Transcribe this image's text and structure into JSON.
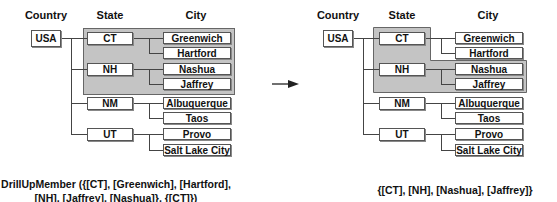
{
  "headers": {
    "country": "Country",
    "state": "State",
    "city": "City"
  },
  "before": {
    "country": "USA",
    "states": [
      {
        "name": "CT",
        "cities": [
          "Greenwich",
          "Hartford"
        ]
      },
      {
        "name": "NH",
        "cities": [
          "Nashua",
          "Jaffrey"
        ]
      },
      {
        "name": "NM",
        "cities": [
          "Albuquerque",
          "Taos"
        ]
      },
      {
        "name": "UT",
        "cities": [
          "Provo",
          "Salt Lake City"
        ]
      }
    ],
    "highlighted": [
      "CT",
      "Greenwich",
      "Hartford",
      "NH",
      "Nashua",
      "Jaffrey"
    ],
    "caption_line1": "DrillUpMember ({[CT], [Greenwich], [Hartford],",
    "caption_line2": "[NH], [Jaffrey], [Nashua]}, {[CT]})"
  },
  "after": {
    "country": "USA",
    "states": [
      {
        "name": "CT",
        "cities": [
          "Greenwich",
          "Hartford"
        ]
      },
      {
        "name": "NH",
        "cities": [
          "Nashua",
          "Jaffrey"
        ]
      },
      {
        "name": "NM",
        "cities": [
          "Albuquerque",
          "Taos"
        ]
      },
      {
        "name": "UT",
        "cities": [
          "Provo",
          "Salt Lake City"
        ]
      }
    ],
    "highlighted": [
      "CT",
      "NH",
      "Nashua",
      "Jaffrey"
    ],
    "caption": "{[CT], [NH], [Nashua], [Jaffrey]}"
  },
  "arrow": "right-arrow",
  "colors": {
    "highlight": "#c4c4c4",
    "border": "#555555",
    "line": "#444444"
  }
}
